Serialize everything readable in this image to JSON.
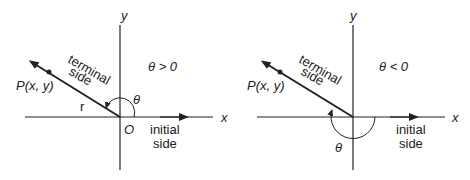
{
  "diagrams": [
    {
      "id": "positive-angle",
      "condition": "θ > 0",
      "axis_x_label": "x",
      "axis_y_label": "y",
      "point_label": "P(x, y)",
      "radius_label": "r",
      "origin_label": "O",
      "angle_label": "θ",
      "terminal_label_1": "terminal",
      "terminal_label_2": "side",
      "initial_label_1": "initial",
      "initial_label_2": "side"
    },
    {
      "id": "negative-angle",
      "condition": "θ < 0",
      "axis_x_label": "x",
      "axis_y_label": "y",
      "point_label": "P(x, y)",
      "angle_label": "θ",
      "terminal_label_1": "terminal",
      "terminal_label_2": "side",
      "initial_label_1": "initial",
      "initial_label_2": "side"
    }
  ],
  "colors": {
    "stroke": "#222222",
    "background": "#ffffff"
  }
}
